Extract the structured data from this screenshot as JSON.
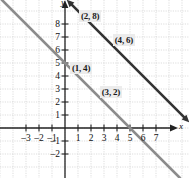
{
  "chart_data": {
    "type": "line",
    "title": "",
    "xlabel": "x",
    "ylabel": "y",
    "xlim": [
      -3.9,
      7.9
    ],
    "ylim": [
      -2.9,
      9.1
    ],
    "grid": true,
    "legend": null,
    "x_ticks": [
      -3,
      -2,
      -1,
      1,
      2,
      3,
      4,
      5,
      6,
      7
    ],
    "y_ticks": [
      -2,
      -1,
      1,
      2,
      3,
      4,
      5,
      6,
      7,
      8
    ],
    "x_tick_labels": [
      "-3",
      "-2",
      "-1",
      "1",
      "2",
      "3",
      "4",
      "5",
      "6",
      "7"
    ],
    "y_tick_labels": [
      "-2",
      "-1",
      "1",
      "2",
      "3",
      "4",
      "5",
      "6",
      "7",
      "8"
    ],
    "series": [
      {
        "name": "upper-line",
        "equation": "y = -x + 10",
        "slope": -1,
        "intercept": 10,
        "color": "#333333",
        "arrows": "both",
        "points": [
          {
            "x": 2,
            "y": 8,
            "label": "(2, 8)"
          },
          {
            "x": 4,
            "y": 6,
            "label": "(4, 6)"
          }
        ]
      },
      {
        "name": "lower-line",
        "equation": "y = -x + 5",
        "slope": -1,
        "intercept": 5,
        "color": "#8c8c8c",
        "arrows": "none",
        "points": [
          {
            "x": 1,
            "y": 4,
            "label": "(1, 4)"
          },
          {
            "x": 3,
            "y": 2,
            "label": "(3, 2)"
          }
        ]
      }
    ],
    "annotations": [
      {
        "text": "(2, 8)",
        "x": 2,
        "y": 8.6
      },
      {
        "text": "(4, 6)",
        "x": 4.6,
        "y": 6.8
      },
      {
        "text": "(1, 4)",
        "x": 1.3,
        "y": 4.6
      },
      {
        "text": "(3, 2)",
        "x": 3.6,
        "y": 2.8
      }
    ],
    "colors": {
      "grid": "#cfcfcf",
      "axis": "#222222",
      "upper_line": "#333333",
      "lower_line": "#8c8c8c",
      "label_bg": "#ececec",
      "background": "#ffffff"
    }
  }
}
